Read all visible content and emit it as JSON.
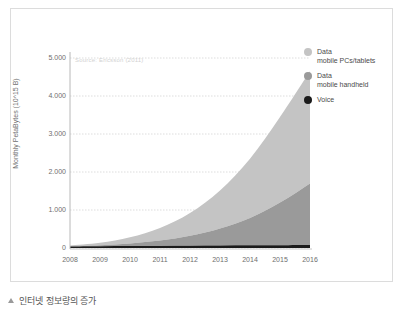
{
  "figure": {
    "caption": "인터넷 정보량의 증가",
    "caption_marker": "triangle-up",
    "source_note": "Source: Ericsson (2011)"
  },
  "legend": {
    "position": "right",
    "items": [
      {
        "label": "Data\nmobile PCs/tablets",
        "color": "#c4c4c4",
        "name": "data-mobile-pcs-tablets"
      },
      {
        "label": "Data\nmobile handheld",
        "color": "#9a9a9a",
        "name": "data-mobile-handheld"
      },
      {
        "label": "Voice",
        "color": "#1b1b1b",
        "name": "voice"
      }
    ]
  },
  "chart_data": {
    "type": "area",
    "stacked": true,
    "title": "",
    "subtitle": "",
    "xlabel": "",
    "ylabel": "Monthly PetaBytes (10^15 B)",
    "categories": [
      "2008",
      "2009",
      "2010",
      "2011",
      "2012",
      "2013",
      "2014",
      "2015",
      "2016"
    ],
    "x": [
      2008,
      2009,
      2010,
      2011,
      2012,
      2013,
      2014,
      2015,
      2016
    ],
    "xlim": [
      2008,
      2016
    ],
    "ylim": [
      0,
      5000
    ],
    "yticks": [
      0,
      1000,
      2000,
      3000,
      4000,
      5000
    ],
    "ytick_labels": [
      "0",
      "1.000",
      "2.000",
      "3.000",
      "4.000",
      "5.000"
    ],
    "grid": true,
    "grid_axis": "y",
    "grid_style": "dotted",
    "series": [
      {
        "name": "Voice",
        "color": "#1b1b1b",
        "values": [
          40,
          45,
          50,
          55,
          60,
          65,
          70,
          75,
          80
        ]
      },
      {
        "name": "Data mobile handheld",
        "color": "#9a9a9a",
        "values": [
          10,
          30,
          70,
          140,
          260,
          450,
          720,
          1120,
          1620
        ]
      },
      {
        "name": "Data mobile PCs/tablets",
        "color": "#c4c4c4",
        "values": [
          15,
          60,
          160,
          330,
          600,
          1000,
          1560,
          2250,
          2950
        ]
      }
    ],
    "cumulative_totals": [
      65,
      135,
      280,
      525,
      920,
      1515,
      2350,
      3445,
      4650
    ]
  }
}
